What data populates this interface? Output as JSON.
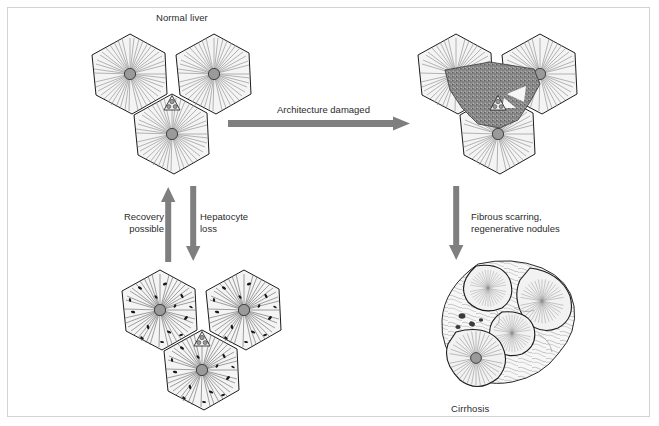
{
  "figure": {
    "frame_color": "#d3d3d3",
    "background_color": "#ffffff"
  },
  "panels": [
    {
      "id": "normal-liver",
      "caption": "Normal liver",
      "caption_position": "top",
      "description": "Three hexagonal hepatic lobules with central veins and radiating sinusoid lines, joined at a portal triad"
    },
    {
      "id": "damaged-liver",
      "caption": "",
      "caption_position": "none",
      "description": "Same three lobules overlaid by a dark stippled triangular zone of architectural damage around the portal triad"
    },
    {
      "id": "hepatocyte-loss-liver",
      "caption": "",
      "caption_position": "none",
      "description": "Three lobules showing scattered dark specks of hepatocyte loss"
    },
    {
      "id": "cirrhotic-liver",
      "caption": "Cirrhosis",
      "caption_position": "bottom",
      "description": "Irregular regenerative nodules separated by wavy fibrous scar bands with inflammatory cell clusters"
    }
  ],
  "arrows": [
    {
      "id": "architecture-damaged",
      "label": "Architecture damaged",
      "direction": "right",
      "color": "#7f7f7f"
    },
    {
      "id": "recovery-possible",
      "label_line1": "Recovery",
      "label_line2": "possible",
      "direction": "up",
      "color": "#7f7f7f"
    },
    {
      "id": "hepatocyte-loss",
      "label_line1": "Hepatocyte",
      "label_line2": "loss",
      "direction": "down",
      "color": "#7f7f7f"
    },
    {
      "id": "fibrous-scarring",
      "label_line1": "Fibrous scarring,",
      "label_line2": "regenerative nodules",
      "direction": "down",
      "color": "#7f7f7f"
    }
  ],
  "colors": {
    "lobule_fill": "#f4f4f4",
    "lobule_stroke": "#1c1c1c",
    "sinusoid": "#8e8e8e",
    "central_vein": "#9a9a9a",
    "damage_zone": "#8a8a8a",
    "necrosis_dot": "#181818",
    "text": "#2b2b2b"
  }
}
